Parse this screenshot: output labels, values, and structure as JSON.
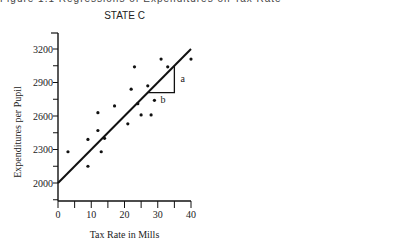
{
  "page": {
    "cut_title": "Figure 1.1 Regressions of Expenditures on Tax Rate"
  },
  "chart_data": [
    {
      "type": "scatter",
      "title": "STATE C",
      "xlabel": "Tax Rate in Mills",
      "ylabel": "Expenditures per Pupil",
      "xlim": [
        0,
        40
      ],
      "ylim": [
        1850,
        3350
      ],
      "xticks": [
        0,
        10,
        20,
        30,
        40
      ],
      "yticks": [
        2000,
        2300,
        2600,
        2900,
        3200
      ],
      "grid": false,
      "regression_line": {
        "x": [
          0,
          40
        ],
        "y": [
          2000,
          3200
        ]
      },
      "slope_triangle": {
        "x1": 27,
        "x2": 35,
        "y1": 2810,
        "y2": 3050,
        "label_rise": "a",
        "label_run": "b"
      },
      "points": [
        {
          "x": 3,
          "y": 2280
        },
        {
          "x": 9,
          "y": 2150
        },
        {
          "x": 9,
          "y": 2390
        },
        {
          "x": 12,
          "y": 2470
        },
        {
          "x": 12,
          "y": 2630
        },
        {
          "x": 13,
          "y": 2280
        },
        {
          "x": 14,
          "y": 2400
        },
        {
          "x": 17,
          "y": 2690
        },
        {
          "x": 21,
          "y": 2530
        },
        {
          "x": 22,
          "y": 2840
        },
        {
          "x": 23,
          "y": 3040
        },
        {
          "x": 24,
          "y": 2710
        },
        {
          "x": 25,
          "y": 2610
        },
        {
          "x": 27,
          "y": 2870
        },
        {
          "x": 28,
          "y": 2610
        },
        {
          "x": 29,
          "y": 2740
        },
        {
          "x": 31,
          "y": 3110
        },
        {
          "x": 33,
          "y": 3040
        },
        {
          "x": 40,
          "y": 3110
        }
      ]
    },
    {
      "type": "scatter",
      "title": "STATE D",
      "xlabel": "Tax Rate in Mills",
      "ylabel": "Expenditures per Pupil",
      "xlim": [
        0,
        40
      ],
      "ylim": [
        1850,
        3350
      ],
      "xticks": [
        0,
        10,
        20,
        30,
        40
      ],
      "yticks": [
        2000,
        2300,
        2600,
        2900,
        3200
      ],
      "grid": false,
      "regression_line": {
        "x": [
          0,
          40
        ],
        "y": [
          2300,
          2450
        ]
      },
      "points": [
        {
          "x": 5,
          "y": 2420
        },
        {
          "x": 8,
          "y": 2280
        },
        {
          "x": 8,
          "y": 2160
        },
        {
          "x": 10,
          "y": 2560
        },
        {
          "x": 10,
          "y": 2360
        },
        {
          "x": 13,
          "y": 2240
        },
        {
          "x": 14,
          "y": 2470
        },
        {
          "x": 19,
          "y": 2300
        },
        {
          "x": 19,
          "y": 2450
        },
        {
          "x": 22,
          "y": 2190
        },
        {
          "x": 23,
          "y": 2390
        },
        {
          "x": 26,
          "y": 2330
        },
        {
          "x": 26,
          "y": 2220
        },
        {
          "x": 28,
          "y": 2580
        },
        {
          "x": 30,
          "y": 2270
        },
        {
          "x": 31,
          "y": 2410
        },
        {
          "x": 32,
          "y": 2440
        },
        {
          "x": 33,
          "y": 2590
        },
        {
          "x": 34,
          "y": 2330
        },
        {
          "x": 37,
          "y": 2490
        }
      ]
    }
  ]
}
